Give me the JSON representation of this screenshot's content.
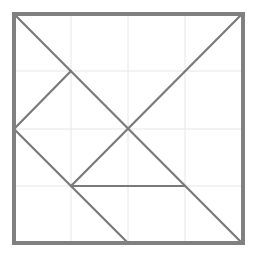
{
  "diagram": {
    "type": "tangram-square",
    "colors": {
      "background": "#ffffff",
      "grid": "#e6e6e6",
      "outline": "#808080",
      "cut_lines": "#7a7a7a"
    },
    "square": {
      "x": 14,
      "y": 14,
      "size": 229,
      "stroke_width": 4
    },
    "grid": {
      "divisions": 4,
      "vertical_x": [
        71,
        128,
        185
      ],
      "horizontal_y": [
        71,
        129,
        186
      ]
    },
    "cut_lines": [
      {
        "name": "main-diagonal",
        "x1": 14,
        "y1": 14,
        "x2": 242,
        "y2": 243
      },
      {
        "name": "anti-diagonal-partial",
        "x1": 242,
        "y1": 14,
        "x2": 71,
        "y2": 186
      },
      {
        "name": "upper-left-segment",
        "x1": 71,
        "y1": 71,
        "x2": 14,
        "y2": 129
      },
      {
        "name": "left-to-bottom-segment",
        "x1": 14,
        "y1": 129,
        "x2": 128,
        "y2": 243
      },
      {
        "name": "horizontal-segment",
        "x1": 71,
        "y1": 186,
        "x2": 185,
        "y2": 186
      }
    ]
  }
}
